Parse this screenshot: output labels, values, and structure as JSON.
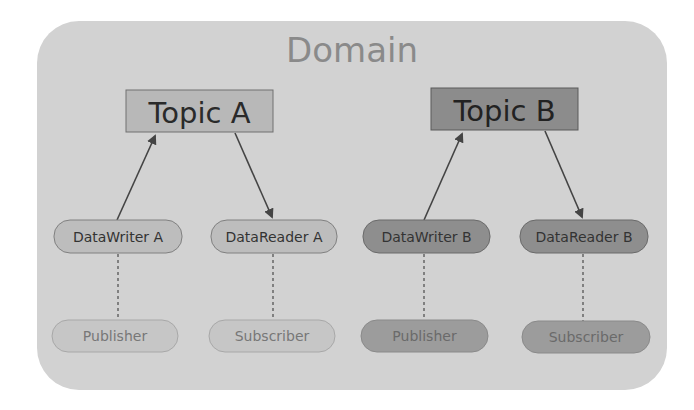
{
  "domain": {
    "title": "Domain",
    "fill": "#d2d2d2",
    "title_color": "#8a8a8a"
  },
  "topics": [
    {
      "label": "Topic A",
      "fill": "#b8b8b8",
      "stroke": "#707070",
      "text_color": "#2a2a2a"
    },
    {
      "label": "Topic B",
      "fill": "#8c8c8c",
      "stroke": "#5a5a5a",
      "text_color": "#222222"
    }
  ],
  "entities": [
    {
      "label": "DataWriter A",
      "fill": "#bdbdbd",
      "stroke": "#808080",
      "text_color": "#333333",
      "group": "A"
    },
    {
      "label": "DataReader A",
      "fill": "#bdbdbd",
      "stroke": "#808080",
      "text_color": "#333333",
      "group": "A"
    },
    {
      "label": "DataWriter B",
      "fill": "#8e8e8e",
      "stroke": "#6a6a6a",
      "text_color": "#333333",
      "group": "B"
    },
    {
      "label": "DataReader B",
      "fill": "#8e8e8e",
      "stroke": "#6a6a6a",
      "text_color": "#333333",
      "group": "B"
    }
  ],
  "participants": [
    {
      "label": "Publisher",
      "fill": "#c6c6c6",
      "stroke": "#a8a8a8",
      "text_color": "#777777",
      "group": "A"
    },
    {
      "label": "Subscriber",
      "fill": "#c6c6c6",
      "stroke": "#a8a8a8",
      "text_color": "#777777",
      "group": "A"
    },
    {
      "label": "Publisher",
      "fill": "#9c9c9c",
      "stroke": "#8a8a8a",
      "text_color": "#6a6a6a",
      "group": "B"
    },
    {
      "label": "Subscriber",
      "fill": "#9c9c9c",
      "stroke": "#8a8a8a",
      "text_color": "#6a6a6a",
      "group": "B"
    }
  ],
  "edges": [
    {
      "from": "DataWriter A",
      "to": "Topic A",
      "style": "arrow"
    },
    {
      "from": "Topic A",
      "to": "DataReader A",
      "style": "arrow"
    },
    {
      "from": "DataWriter B",
      "to": "Topic B",
      "style": "arrow"
    },
    {
      "from": "Topic B",
      "to": "DataReader B",
      "style": "arrow"
    },
    {
      "from": "DataWriter A",
      "to": "Publisher",
      "style": "dashed"
    },
    {
      "from": "DataReader A",
      "to": "Subscriber",
      "style": "dashed"
    },
    {
      "from": "DataWriter B",
      "to": "Publisher",
      "style": "dashed"
    },
    {
      "from": "DataReader B",
      "to": "Subscriber",
      "style": "dashed"
    }
  ],
  "colors": {
    "edge": "#444444",
    "dashed": "#555555"
  }
}
